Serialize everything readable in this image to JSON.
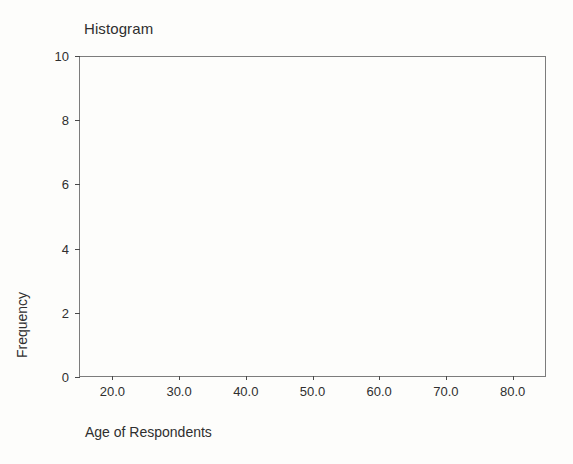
{
  "chart_data": {
    "type": "bar",
    "title": "Histogram",
    "xlabel": "Age of Respondents",
    "ylabel": "Frequency",
    "xlim": [
      15.0,
      85.0
    ],
    "ylim": [
      0,
      10
    ],
    "grid": false,
    "legend": null,
    "x_ticks": [
      20.0,
      30.0,
      40.0,
      50.0,
      60.0,
      70.0,
      80.0
    ],
    "x_tick_labels": [
      "20.0",
      "30.0",
      "40.0",
      "50.0",
      "60.0",
      "70.0",
      "80.0"
    ],
    "y_ticks": [
      0,
      2,
      4,
      6,
      8,
      10
    ],
    "y_tick_labels": [
      "0",
      "2",
      "4",
      "6",
      "8",
      "10"
    ],
    "categories": [],
    "values": [],
    "annotations": []
  },
  "figure": {
    "title": "Histogram",
    "x_axis_title": "Age of Respondents",
    "y_axis_title": "Frequency",
    "background_color": "#fdfdfb",
    "frame_color": "#7c7c7c",
    "text_color": "#2f2f2f"
  }
}
